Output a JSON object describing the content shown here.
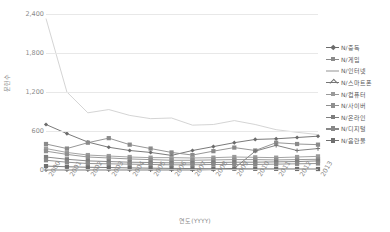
{
  "chart_data": {
    "type": "line",
    "title": "",
    "xlabel": "연도(YYYY)",
    "ylabel": "문헌수",
    "ylim": [
      0,
      2400
    ],
    "yticks": [
      "0",
      "600",
      "1,200",
      "1,800",
      "2,400"
    ],
    "ytick_values": [
      0,
      600,
      1200,
      1800,
      2400
    ],
    "grid": true,
    "legend_position": "right",
    "categories": [
      "2000",
      "2001",
      "2002",
      "2003",
      "2004",
      "2005",
      "2006",
      "2007",
      "2008",
      "2009",
      "2010",
      "2011",
      "2012",
      "2013"
    ],
    "series": [
      {
        "name": "N/중독",
        "color": "#6b6b6b",
        "marker": "diamond",
        "values": [
          700,
          560,
          430,
          350,
          300,
          270,
          225,
          300,
          360,
          420,
          470,
          480,
          500,
          520
        ]
      },
      {
        "name": "N/게임",
        "color": "#8a8a8a",
        "marker": "square",
        "values": [
          400,
          330,
          420,
          490,
          390,
          330,
          270,
          230,
          290,
          345,
          300,
          420,
          400,
          390
        ]
      },
      {
        "name": "N/인터넷",
        "color": "#c9c9c9",
        "marker": "none",
        "values": [
          2330,
          1200,
          880,
          930,
          840,
          790,
          800,
          690,
          700,
          760,
          700,
          620,
          580,
          545
        ]
      },
      {
        "name": "N/스마트폰",
        "color": "#757575",
        "marker": "cross",
        "values": [
          0,
          0,
          0,
          0,
          0,
          0,
          0,
          0,
          5,
          25,
          290,
          380,
          300,
          330
        ]
      },
      {
        "name": "N/컴퓨터",
        "color": "#9a9a9a",
        "marker": "square",
        "values": [
          330,
          270,
          230,
          215,
          200,
          190,
          190,
          185,
          190,
          200,
          195,
          190,
          200,
          210
        ]
      },
      {
        "name": "N/사이버",
        "color": "#8f8f8f",
        "marker": "square",
        "values": [
          290,
          240,
          200,
          185,
          170,
          160,
          150,
          150,
          155,
          160,
          160,
          155,
          160,
          165
        ]
      },
      {
        "name": "N/온라인",
        "color": "#7e7e7e",
        "marker": "square",
        "values": [
          200,
          165,
          140,
          130,
          120,
          115,
          110,
          110,
          115,
          120,
          120,
          125,
          130,
          140
        ]
      },
      {
        "name": "N/디지털",
        "color": "#888888",
        "marker": "square",
        "values": [
          150,
          120,
          100,
          95,
          90,
          85,
          80,
          80,
          85,
          85,
          85,
          90,
          95,
          100
        ]
      },
      {
        "name": "N/음란물",
        "color": "#6f6f6f",
        "marker": "square",
        "values": [
          60,
          50,
          42,
          38,
          32,
          28,
          25,
          22,
          20,
          20,
          18,
          18,
          16,
          15
        ]
      }
    ]
  }
}
